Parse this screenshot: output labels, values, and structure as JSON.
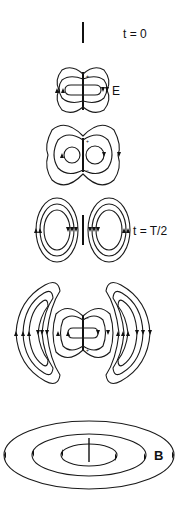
{
  "figure": {
    "frames": [
      {
        "id": "t0",
        "label": "t = 0",
        "description": "dipole only, no field lines"
      },
      {
        "id": "e-field-1",
        "label": "E",
        "description": "electric field loops around dipole"
      },
      {
        "id": "e-field-2",
        "label": "",
        "description": "field loops expanding, pinching"
      },
      {
        "id": "tHalf",
        "label": "t = T/2",
        "description": "detached closed field loops"
      },
      {
        "id": "e-field-3",
        "label": "",
        "description": "detached loops propagating outward with new loops near dipole"
      },
      {
        "id": "b-field",
        "label": "B",
        "description": "concentric magnetic field ellipses around dipole"
      }
    ],
    "dipole_markers": {
      "plus": "+",
      "minus": "−"
    },
    "colors": {
      "line": "#1a1a1a",
      "background": "#ffffff"
    }
  }
}
